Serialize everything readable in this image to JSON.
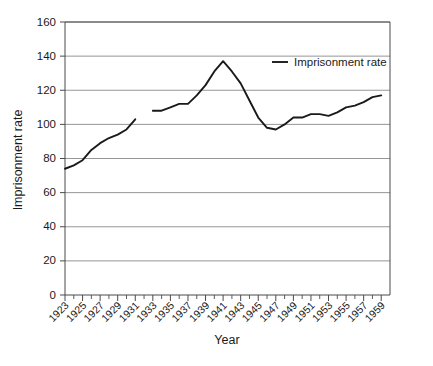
{
  "chart_data": {
    "type": "line",
    "title": "",
    "xlabel": "Year",
    "ylabel": "Imprisonment rate",
    "xlim": [
      1923,
      1960
    ],
    "ylim": [
      0,
      160
    ],
    "ytick_step": 20,
    "yticks": [
      0,
      20,
      40,
      60,
      80,
      100,
      120,
      140,
      160
    ],
    "xticks": [
      1923,
      1925,
      1927,
      1929,
      1931,
      1933,
      1935,
      1937,
      1939,
      1941,
      1943,
      1945,
      1947,
      1949,
      1951,
      1953,
      1955,
      1957,
      1959
    ],
    "xticks_minor": [
      1924,
      1926,
      1928,
      1930,
      1932,
      1934,
      1936,
      1938,
      1940,
      1942,
      1944,
      1946,
      1948,
      1950,
      1952,
      1954,
      1956,
      1958
    ],
    "grid": "horizontal",
    "legend_position": "top-right",
    "legend": [
      "Imprisonment rate"
    ],
    "series": [
      {
        "name": "Imprisonment rate",
        "x": [
          1923,
          1924,
          1925,
          1926,
          1927,
          1928,
          1929,
          1930,
          1931,
          1933,
          1934,
          1935,
          1936,
          1937,
          1938,
          1939,
          1940,
          1941,
          1942,
          1943,
          1944,
          1945,
          1946,
          1947,
          1948,
          1949,
          1950,
          1951,
          1952,
          1953,
          1954,
          1955,
          1956,
          1957,
          1958,
          1959
        ],
        "values": [
          74,
          76,
          79,
          85,
          89,
          92,
          94,
          97,
          103,
          108,
          108,
          110,
          112,
          112,
          117,
          123,
          131,
          137,
          131,
          124,
          114,
          104,
          98,
          97,
          100,
          104,
          104,
          106,
          106,
          105,
          107,
          110,
          111,
          113,
          116,
          117
        ],
        "gaps": [
          [
            1931,
            1933
          ]
        ]
      }
    ]
  },
  "axes": {
    "x_title": "Year",
    "y_title": "Imprisonment rate"
  },
  "legend": {
    "entries": [
      {
        "label": "Imprisonment rate",
        "color": "#1a1a1a"
      }
    ]
  },
  "colors": {
    "series": "#1a1a1a",
    "grid": "#8a8a8a",
    "axis": "#4a4a4a",
    "background": "#ffffff"
  }
}
